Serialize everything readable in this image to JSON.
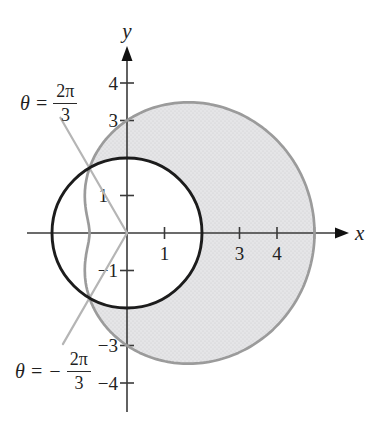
{
  "figure": {
    "annotations": {
      "upper": {
        "lhs": "θ =",
        "num": "2π",
        "den": "3",
        "value": "2π/3"
      },
      "lower": {
        "lhs": "θ = −",
        "num": "2π",
        "den": "3",
        "value": "−2π/3"
      }
    }
  },
  "chart_data": {
    "type": "line",
    "subtype": "polar-region",
    "title": "",
    "grid": false,
    "legend": false,
    "axis_color": "#3a3a3a",
    "text_color": "#222222",
    "axes": {
      "x": {
        "label": "x",
        "range": [
          -2.7,
          5.9
        ],
        "ticks": [
          {
            "v": 1,
            "label": "1"
          },
          {
            "v": 3,
            "label": "3"
          },
          {
            "v": 4,
            "label": "4"
          },
          {
            "v": 5,
            "label": ""
          }
        ]
      },
      "y": {
        "label": "y",
        "range": [
          -4.8,
          5.0
        ],
        "ticks": [
          {
            "v": 4,
            "label": "4"
          },
          {
            "v": 3,
            "label": "3"
          },
          {
            "v": 1,
            "label": "1"
          },
          {
            "v": -1,
            "label": "−1"
          },
          {
            "v": -3,
            "label": "−3"
          },
          {
            "v": -4,
            "label": "−4"
          }
        ]
      }
    },
    "curves": [
      {
        "id": "limacon",
        "equation": "r = 3 + 2 cos θ",
        "a": 3,
        "b": 2,
        "stroke": "#9b9b9b",
        "stroke_width": 2.7,
        "key_points": [
          [
            5,
            0
          ],
          [
            0,
            3
          ],
          [
            -1,
            0
          ],
          [
            0,
            -3
          ]
        ]
      },
      {
        "id": "circle",
        "equation": "r = 2",
        "radius": 2,
        "center": [
          0,
          0
        ],
        "stroke": "#1c1c1c",
        "stroke_width": 2.9
      }
    ],
    "rays": [
      {
        "id": "upper",
        "angle_radians": 2.0944,
        "angle_label": "θ = 2π/3",
        "length": 3.55,
        "stroke": "#b5b5b5"
      },
      {
        "id": "lower",
        "angle_radians": -2.0944,
        "angle_label": "θ = −2π/3",
        "length": 3.42,
        "stroke": "#b5b5b5"
      }
    ],
    "shaded_region": {
      "rule": "inside limaçon r = 3 + 2 cos θ and outside circle r = 2",
      "theta_min": -2.0944,
      "theta_max": 2.0944,
      "fill": "#e5e5e7",
      "dot_color": "#c9c9cd"
    },
    "intersections": [
      [
        -1,
        1.732
      ],
      [
        -1,
        -1.732
      ]
    ]
  }
}
